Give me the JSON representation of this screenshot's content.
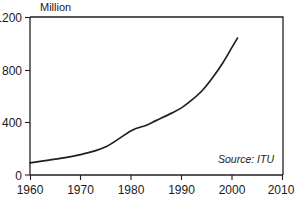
{
  "chart_data": {
    "type": "line",
    "title": "",
    "subtitle": "",
    "ylabel": "Million",
    "xlabel": "",
    "xlim": [
      1960,
      2010
    ],
    "ylim": [
      0,
      1200
    ],
    "grid": false,
    "legend": null,
    "annotations": [
      {
        "name": "source",
        "text": "Source: ITU"
      }
    ],
    "xticks": [
      "1960",
      "1970",
      "1980",
      "1990",
      "2000",
      "2010"
    ],
    "xtick_values": [
      1960,
      1970,
      1980,
      1990,
      2000,
      2010
    ],
    "yticks": [
      "0",
      "400",
      "800",
      "1200"
    ],
    "ytick_values": [
      0,
      400,
      800,
      1200
    ],
    "series": [
      {
        "name": "Telephone lines",
        "color": "#231f20",
        "x": [
          1960,
          1965,
          1970,
          1975,
          1980,
          1983,
          1985,
          1988,
          1990,
          1992,
          1994,
          1996,
          1998,
          2000,
          2001
        ],
        "values": [
          92,
          120,
          155,
          215,
          337,
          378,
          415,
          470,
          512,
          570,
          640,
          735,
          845,
          975,
          1040
        ]
      }
    ]
  },
  "labels": {
    "y_axis_title": "Million",
    "source_note": "Source: ITU",
    "ytick_0": "0",
    "ytick_1": "400",
    "ytick_2": "800",
    "ytick_3": "1200",
    "xtick_0": "1960",
    "xtick_1": "1970",
    "xtick_2": "1980",
    "xtick_3": "1990",
    "xtick_4": "2000",
    "xtick_5": "2010"
  },
  "colors": {
    "line": "#231f20",
    "frame": "#231f20",
    "background": "#ffffff",
    "text": "#1a1a1a"
  }
}
